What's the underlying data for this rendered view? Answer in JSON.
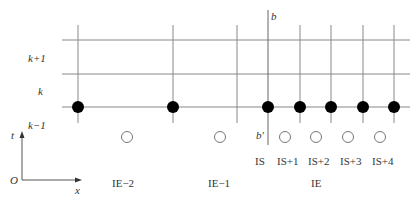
{
  "diagram": {
    "type": "finite-difference-grid",
    "colors": {
      "line": "#888888",
      "dot": "#000000",
      "hollow_stroke": "#777777",
      "text": "#333333"
    },
    "row_labels": [
      {
        "text": "k+1",
        "x": 28,
        "y": 53
      },
      {
        "text": "k",
        "x": 38,
        "y": 86
      },
      {
        "text": "k−1",
        "x": 28,
        "y": 120
      }
    ],
    "boundary_labels": {
      "top": "b",
      "bottom": "b′"
    },
    "axes": {
      "t_label": "t",
      "x_label": "x",
      "origin_label": "O"
    },
    "column_labels": [
      {
        "text": "IS",
        "x": 255,
        "y": 156
      },
      {
        "text": "IS+1",
        "x": 277,
        "y": 156
      },
      {
        "text": "IS+2",
        "x": 308,
        "y": 156
      },
      {
        "text": "IS+3",
        "x": 340,
        "y": 156
      },
      {
        "text": "IS+4",
        "x": 372,
        "y": 156
      }
    ],
    "element_labels": [
      {
        "text": "IE−2",
        "x": 112,
        "y": 178
      },
      {
        "text": "IE−1",
        "x": 208,
        "y": 178
      },
      {
        "text": "IE",
        "x": 311,
        "y": 178
      }
    ],
    "horizontal_lines_y": [
      40,
      74,
      107
    ],
    "vertical_lines_x": [
      78,
      173,
      237,
      300,
      331,
      363,
      394
    ],
    "boundary_line_x": 268,
    "filled_nodes_x": [
      78,
      173,
      268,
      300,
      331,
      363,
      394
    ],
    "hollow_nodes_x": [
      127,
      220,
      285,
      316,
      348,
      380
    ]
  }
}
